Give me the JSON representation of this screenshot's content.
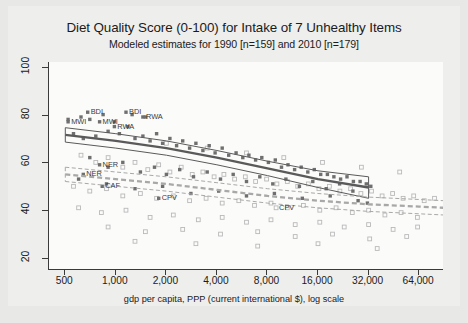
{
  "chart_data": {
    "type": "scatter",
    "title": "Diet Quality Score (0-100) for Intake of 7 Unhealthy Items",
    "subtitle": "Modeled estimates for 1990 [n=159] and 2010 [n=179]",
    "xlabel": "gdp per capita, PPP (current international $), log scale",
    "ylabel": "",
    "xscale": "log",
    "xlim": [
      400,
      90000
    ],
    "ylim": [
      15,
      102
    ],
    "xticks": [
      500,
      1000,
      2000,
      4000,
      8000,
      16000,
      32000,
      64000
    ],
    "xtick_labels": [
      "500",
      "1,000",
      "2,000",
      "4,000",
      "8,000",
      "16,000",
      "32,000",
      "64,000"
    ],
    "yticks": [
      20,
      40,
      60,
      80,
      100
    ],
    "ytick_labels": [
      "20",
      "40",
      "60",
      "80",
      "100"
    ],
    "grid": false,
    "legend": "none",
    "series": [
      {
        "name": "1990",
        "marker": "filled-square",
        "color": "#6f6f6f",
        "n": 159,
        "points": [
          [
            620,
            79
          ],
          [
            840,
            80
          ],
          [
            1250,
            80
          ],
          [
            1500,
            79
          ],
          [
            520,
            78
          ],
          [
            700,
            78
          ],
          [
            980,
            77
          ],
          [
            1180,
            75
          ],
          [
            560,
            72
          ],
          [
            640,
            70
          ],
          [
            760,
            71
          ],
          [
            900,
            73
          ],
          [
            1050,
            72
          ],
          [
            1300,
            70
          ],
          [
            1450,
            71
          ],
          [
            1600,
            69
          ],
          [
            1750,
            72
          ],
          [
            1900,
            68
          ],
          [
            2100,
            70
          ],
          [
            2300,
            67
          ],
          [
            2500,
            69
          ],
          [
            2750,
            66
          ],
          [
            3000,
            68
          ],
          [
            3300,
            65
          ],
          [
            3600,
            67
          ],
          [
            3900,
            64
          ],
          [
            4300,
            66
          ],
          [
            4700,
            63
          ],
          [
            5200,
            64
          ],
          [
            5700,
            62
          ],
          [
            6200,
            63
          ],
          [
            6800,
            61
          ],
          [
            7400,
            62
          ],
          [
            8100,
            60
          ],
          [
            8900,
            61
          ],
          [
            9700,
            58
          ],
          [
            10600,
            59
          ],
          [
            11600,
            57
          ],
          [
            12700,
            58
          ],
          [
            13900,
            56
          ],
          [
            15200,
            57
          ],
          [
            16600,
            55
          ],
          [
            18200,
            55
          ],
          [
            19900,
            54
          ],
          [
            21800,
            53
          ],
          [
            23800,
            54
          ],
          [
            26000,
            52
          ],
          [
            28500,
            52
          ],
          [
            31000,
            51
          ],
          [
            33000,
            50
          ],
          [
            700,
            62
          ],
          [
            900,
            58
          ],
          [
            1100,
            60
          ],
          [
            1400,
            56
          ],
          [
            1700,
            58
          ],
          [
            2000,
            55
          ],
          [
            2400,
            57
          ],
          [
            2900,
            54
          ],
          [
            3500,
            56
          ],
          [
            4200,
            53
          ],
          [
            5000,
            55
          ],
          [
            6000,
            52
          ],
          [
            7200,
            54
          ],
          [
            8600,
            51
          ],
          [
            10300,
            53
          ],
          [
            12400,
            50
          ],
          [
            14900,
            52
          ],
          [
            17900,
            49
          ],
          [
            21500,
            51
          ],
          [
            25800,
            48
          ],
          [
            600,
            53
          ],
          [
            880,
            51
          ],
          [
            1300,
            49
          ],
          [
            1900,
            50
          ],
          [
            2800,
            47
          ],
          [
            4100,
            48
          ],
          [
            6000,
            46
          ],
          [
            8800,
            47
          ],
          [
            12900,
            45
          ],
          [
            18900,
            46
          ],
          [
            27700,
            44
          ],
          [
            31500,
            43
          ]
        ],
        "labeled_points": [
          {
            "label": "BDI",
            "x": 680,
            "y": 81
          },
          {
            "label": "BDI",
            "x": 1150,
            "y": 81
          },
          {
            "label": "RWA",
            "x": 1450,
            "y": 79
          },
          {
            "label": "MWI",
            "x": 520,
            "y": 77
          },
          {
            "label": "MWI",
            "x": 800,
            "y": 77
          },
          {
            "label": "RWA",
            "x": 980,
            "y": 75
          },
          {
            "label": "NER",
            "x": 800,
            "y": 59
          },
          {
            "label": "NER",
            "x": 640,
            "y": 55
          },
          {
            "label": "CAF",
            "x": 830,
            "y": 50
          },
          {
            "label": "CPV",
            "x": 1800,
            "y": 45
          }
        ]
      },
      {
        "name": "2010",
        "marker": "open-square",
        "color": "#b9b9b9",
        "n": 179,
        "points": [
          [
            620,
            63
          ],
          [
            760,
            60
          ],
          [
            900,
            62
          ],
          [
            1100,
            58
          ],
          [
            1300,
            60
          ],
          [
            1550,
            57
          ],
          [
            1800,
            59
          ],
          [
            2100,
            56
          ],
          [
            2450,
            58
          ],
          [
            2850,
            55
          ],
          [
            3300,
            56
          ],
          [
            3850,
            54
          ],
          [
            4400,
            55
          ],
          [
            5100,
            53
          ],
          [
            5900,
            54
          ],
          [
            6800,
            52
          ],
          [
            7900,
            53
          ],
          [
            9100,
            51
          ],
          [
            10500,
            52
          ],
          [
            12100,
            50
          ],
          [
            14000,
            51
          ],
          [
            16200,
            49
          ],
          [
            18700,
            50
          ],
          [
            21600,
            48
          ],
          [
            25000,
            49
          ],
          [
            28800,
            47
          ],
          [
            33300,
            48
          ],
          [
            38500,
            46
          ],
          [
            44500,
            47
          ],
          [
            51400,
            45
          ],
          [
            59400,
            46
          ],
          [
            68600,
            44
          ],
          [
            79000,
            45
          ],
          [
            560,
            50
          ],
          [
            700,
            48
          ],
          [
            880,
            49
          ],
          [
            1100,
            46
          ],
          [
            1400,
            47
          ],
          [
            1750,
            45
          ],
          [
            2200,
            46
          ],
          [
            2750,
            44
          ],
          [
            3450,
            45
          ],
          [
            4300,
            43
          ],
          [
            5400,
            44
          ],
          [
            6700,
            42
          ],
          [
            8400,
            43
          ],
          [
            10500,
            41
          ],
          [
            13100,
            42
          ],
          [
            16400,
            40
          ],
          [
            20500,
            41
          ],
          [
            25600,
            39
          ],
          [
            32000,
            40
          ],
          [
            40000,
            38
          ],
          [
            50000,
            39
          ],
          [
            62500,
            37
          ],
          [
            600,
            41
          ],
          [
            820,
            39
          ],
          [
            1150,
            40
          ],
          [
            1600,
            37
          ],
          [
            2200,
            38
          ],
          [
            3100,
            36
          ],
          [
            4300,
            37
          ],
          [
            6000,
            35
          ],
          [
            8400,
            36
          ],
          [
            11700,
            34
          ],
          [
            16400,
            35
          ],
          [
            22900,
            33
          ],
          [
            32000,
            34
          ],
          [
            44800,
            32
          ],
          [
            62700,
            33
          ],
          [
            900,
            33
          ],
          [
            1500,
            31
          ],
          [
            2500,
            32
          ],
          [
            4200,
            30
          ],
          [
            7000,
            31
          ],
          [
            11700,
            29
          ],
          [
            19500,
            30
          ],
          [
            32500,
            28
          ],
          [
            54000,
            29
          ],
          [
            1300,
            27
          ],
          [
            3000,
            26
          ],
          [
            7000,
            25
          ],
          [
            16000,
            26
          ],
          [
            36000,
            24
          ],
          [
            2000,
            68
          ],
          [
            3500,
            66
          ],
          [
            6000,
            64
          ],
          [
            10000,
            62
          ],
          [
            17000,
            60
          ],
          [
            29000,
            58
          ],
          [
            49000,
            56
          ]
        ],
        "labeled_points": [
          {
            "label": "CPV",
            "x": 9000,
            "y": 41
          }
        ]
      }
    ],
    "fitted_curves": [
      {
        "name": "1990 fit",
        "style": "solid",
        "color": "#5a5a5a",
        "band": "solid-outline",
        "x": [
          500,
          1000,
          2000,
          4000,
          8000,
          16000,
          32000
        ],
        "y": [
          71.5,
          69.0,
          66.0,
          62.0,
          57.5,
          53.0,
          49.5
        ],
        "ci_upper": [
          74.5,
          72.0,
          69.0,
          65.0,
          60.5,
          56.5,
          54.0
        ],
        "ci_lower": [
          68.5,
          66.0,
          63.0,
          59.0,
          54.5,
          49.5,
          45.0
        ]
      },
      {
        "name": "2010 fit",
        "style": "dashed",
        "color": "#a8a8a8",
        "band": "dashed-outline",
        "x": [
          500,
          1000,
          2000,
          4000,
          8000,
          16000,
          32000,
          64000,
          90000
        ],
        "y": [
          55.0,
          53.0,
          51.0,
          48.5,
          46.0,
          44.0,
          42.5,
          41.5,
          41.0
        ],
        "ci_upper": [
          58.0,
          56.0,
          54.0,
          51.5,
          49.0,
          47.0,
          45.5,
          44.5,
          44.0
        ],
        "ci_lower": [
          52.0,
          50.0,
          48.0,
          45.5,
          43.0,
          41.0,
          39.5,
          38.5,
          38.0
        ]
      }
    ]
  }
}
